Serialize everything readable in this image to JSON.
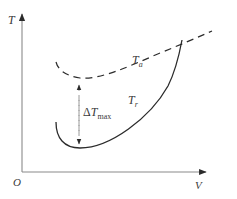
{
  "diagram": {
    "type": "temperature-velocity schematic",
    "axes": {
      "y_label": "T",
      "x_label": "V",
      "origin_label": "O"
    },
    "curves": [
      {
        "id": "ambient",
        "label_main": "T",
        "label_sub": "a",
        "style": "dashed",
        "description": "ambient temperature, shallow U rising to the right"
      },
      {
        "id": "recovery",
        "label_main": "T",
        "label_sub": "r",
        "style": "solid",
        "description": "deep U with minimum, rising steeply to cross T_a"
      }
    ],
    "annotation": {
      "delta_symbol": "Δ",
      "label_main": "T",
      "label_sub": "max",
      "meaning": "maximum temperature difference between T_a and T_r minimum",
      "style": "dashed double-headed arrow"
    },
    "colors": {
      "axis": "#8a8a8a",
      "curve": "#2b2b2b",
      "text": "#3a3a3a",
      "background": "#ffffff"
    }
  }
}
